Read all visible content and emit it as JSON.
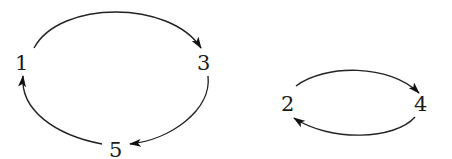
{
  "diagram": {
    "type": "directed-cycle-graph",
    "components": [
      {
        "name": "cycle-1-3-5",
        "nodes": [
          "1",
          "3",
          "5"
        ],
        "edges": [
          {
            "from": "1",
            "to": "3"
          },
          {
            "from": "3",
            "to": "5"
          },
          {
            "from": "5",
            "to": "1"
          }
        ]
      },
      {
        "name": "cycle-2-4",
        "nodes": [
          "2",
          "4"
        ],
        "edges": [
          {
            "from": "2",
            "to": "4"
          },
          {
            "from": "4",
            "to": "2"
          }
        ]
      }
    ],
    "nodes": {
      "n1": {
        "label": "1"
      },
      "n3": {
        "label": "3"
      },
      "n5": {
        "label": "5"
      },
      "n2": {
        "label": "2"
      },
      "n4": {
        "label": "4"
      }
    },
    "colors": {
      "stroke": "#222222",
      "text": "#1a1a1a",
      "background": "#ffffff"
    }
  }
}
